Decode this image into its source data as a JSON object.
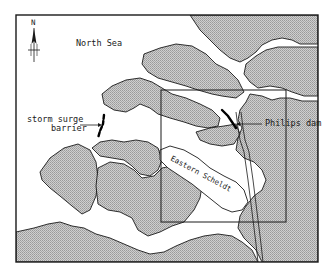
{
  "map": {
    "title": "Dutch delta — Eastern Scheldt area",
    "labels": {
      "north": "N",
      "sea": "North Sea",
      "barrier_line1": "storm surge",
      "barrier_line2": "barrier",
      "dam": "Philips dam",
      "estuary": "Eastern Scheldt"
    },
    "features": {
      "north_arrow": "north-arrow-icon",
      "storm_surge_barrier": "storm-surge-barrier",
      "philips_dam": "philips-dam",
      "inset_rectangle": "inset-frame",
      "canal": "canal"
    },
    "colors": {
      "frame": "#1a1a1a",
      "land_fill": "#c8c8c8",
      "land_hatch": "#9a9a9a",
      "water": "#ffffff",
      "dam": "#000000"
    },
    "frame": {
      "x": 16,
      "y": 15,
      "width": 302,
      "height": 247
    },
    "inset": {
      "x": 161,
      "y": 90,
      "width": 125,
      "height": 132
    }
  }
}
